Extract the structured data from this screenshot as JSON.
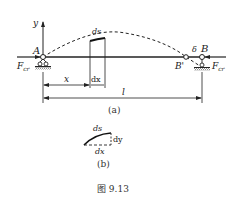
{
  "figure": {
    "caption": "图 9.13",
    "subfig_a_label": "(a)",
    "subfig_b_label": "(b)"
  },
  "panel_a": {
    "axis_y_label": "y",
    "point_A": "A",
    "point_B": "B",
    "point_B_prime": "B'",
    "delta_label": "δ",
    "force_left": "F",
    "force_left_sub": "cr",
    "force_right": "F",
    "force_right_sub": "cr",
    "ds_label": "ds",
    "dim_x": "x",
    "dim_dx": "dx",
    "dim_l": "l"
  },
  "panel_b": {
    "ds_label": "ds",
    "dy_label": "dy",
    "dx_label": "dx"
  },
  "colors": {
    "ink": "#222222",
    "background": "#ffffff"
  }
}
